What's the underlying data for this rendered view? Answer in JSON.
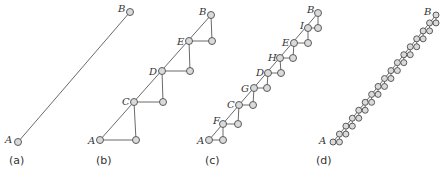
{
  "figure": {
    "colors": {
      "edge": "#6a6a6a",
      "node_fill": "#dadada",
      "node_stroke": "#5a5a5a",
      "text": "#333333"
    },
    "panels": [
      {
        "id": "a",
        "caption": "(a)",
        "caption_pos": [
          9,
          164
        ],
        "start": [
          18,
          142
        ],
        "end": [
          130,
          12
        ],
        "steps": 0,
        "labels": [
          {
            "text": "A",
            "x": 5,
            "y": 143
          },
          {
            "text": "B",
            "x": 118,
            "y": 12
          }
        ]
      },
      {
        "id": "b",
        "caption": "(b)",
        "caption_pos": [
          96,
          164
        ],
        "diagonal_nodes": [
          [
            100,
            140
          ],
          [
            134,
            102
          ],
          [
            162,
            71
          ],
          [
            189,
            41
          ],
          [
            211,
            15
          ]
        ],
        "right_nodes": [
          [
            136,
            140
          ],
          [
            163,
            102
          ],
          [
            190,
            71
          ],
          [
            212,
            41
          ]
        ],
        "labels": [
          {
            "text": "A",
            "x": 88,
            "y": 144
          },
          {
            "text": "C",
            "x": 122,
            "y": 105
          },
          {
            "text": "D",
            "x": 149,
            "y": 75
          },
          {
            "text": "E",
            "x": 177,
            "y": 45
          },
          {
            "text": "B",
            "x": 199,
            "y": 15
          }
        ]
      },
      {
        "id": "c",
        "caption": "(c)",
        "caption_pos": [
          205,
          164
        ],
        "diagonal_nodes": [
          [
            209,
            140
          ],
          [
            223,
            124
          ],
          [
            239,
            105
          ],
          [
            254,
            88
          ],
          [
            268,
            73
          ],
          [
            280,
            58
          ],
          [
            294,
            43
          ],
          [
            308,
            28
          ],
          [
            318,
            13
          ]
        ],
        "right_nodes": [
          [
            223,
            140
          ],
          [
            238,
            124
          ],
          [
            253,
            105
          ],
          [
            267,
            88
          ],
          [
            281,
            73
          ],
          [
            293,
            58
          ],
          [
            308,
            43
          ],
          [
            318,
            28
          ]
        ],
        "labels": [
          {
            "text": "A",
            "x": 197,
            "y": 144
          },
          {
            "text": "F",
            "x": 213,
            "y": 124
          },
          {
            "text": "C",
            "x": 227,
            "y": 108
          },
          {
            "text": "G",
            "x": 241,
            "y": 92
          },
          {
            "text": "D",
            "x": 256,
            "y": 76
          },
          {
            "text": "H",
            "x": 268,
            "y": 61
          },
          {
            "text": "E",
            "x": 282,
            "y": 46
          },
          {
            "text": "I",
            "x": 300,
            "y": 29
          },
          {
            "text": "B",
            "x": 307,
            "y": 13
          }
        ]
      },
      {
        "id": "d",
        "caption": "(d)",
        "caption_pos": [
          316,
          164
        ],
        "start": [
          333,
          142
        ],
        "end": [
          436,
          15
        ],
        "steps": 16,
        "labels": [
          {
            "text": "A",
            "x": 319,
            "y": 144
          },
          {
            "text": "B",
            "x": 424,
            "y": 15
          }
        ]
      }
    ]
  }
}
